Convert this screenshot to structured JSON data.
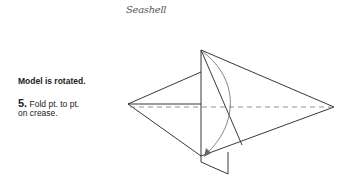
{
  "header": {
    "title": "Seashell"
  },
  "instructions": {
    "note": "Model is rotated.",
    "step_number": "5.",
    "step_text_line1": " Fold pt. to pt.",
    "step_text_line2": "on crease."
  },
  "diagram": {
    "line_color": "#222222",
    "crease_color": "#888888",
    "arrow_color": "#666666"
  }
}
